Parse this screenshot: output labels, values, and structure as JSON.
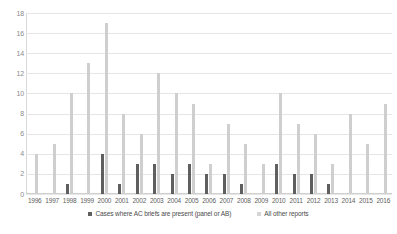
{
  "chart_data": {
    "type": "bar",
    "title": "",
    "xlabel": "",
    "ylabel": "",
    "ylim": [
      0,
      18
    ],
    "ytick_values": [
      0,
      2,
      4,
      6,
      8,
      10,
      12,
      14,
      16,
      18
    ],
    "grid": true,
    "legend_position": "bottom",
    "categories": [
      "1996",
      "1997",
      "1998",
      "1999",
      "2000",
      "2001",
      "2002",
      "2003",
      "2004",
      "2005",
      "2006",
      "2007",
      "2008",
      "2009",
      "2010",
      "2011",
      "2012",
      "2013",
      "2014",
      "2015",
      "2016"
    ],
    "series": [
      {
        "name": "Cases where AC briefs are present (panel or AB)",
        "color": "#5f5f5f",
        "values": [
          0,
          0,
          1,
          0,
          4,
          1,
          3,
          3,
          2,
          3,
          2,
          2,
          1,
          0,
          3,
          2,
          2,
          1,
          0,
          0,
          0
        ]
      },
      {
        "name": "All other reports",
        "color": "#cfcfcf",
        "values": [
          4,
          5,
          10,
          13,
          17,
          8,
          6,
          12,
          10,
          9,
          3,
          7,
          5,
          3,
          10,
          7,
          6,
          3,
          8,
          5,
          9
        ]
      }
    ]
  },
  "legend": {
    "items": [
      {
        "label": "Cases where AC briefs are present (panel or AB)",
        "swatch": "dark"
      },
      {
        "label": "All other reports",
        "swatch": "light"
      }
    ]
  }
}
